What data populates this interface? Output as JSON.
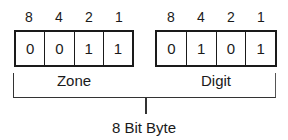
{
  "diagram": {
    "title": "8 Bit Byte",
    "zone": {
      "label": "Zone",
      "weights": [
        "8",
        "4",
        "2",
        "1"
      ],
      "bits": [
        "0",
        "0",
        "1",
        "1"
      ]
    },
    "digit": {
      "label": "Digit",
      "weights": [
        "8",
        "4",
        "2",
        "1"
      ],
      "bits": [
        "0",
        "1",
        "0",
        "1"
      ]
    },
    "caption": "8 Bit Byte"
  }
}
